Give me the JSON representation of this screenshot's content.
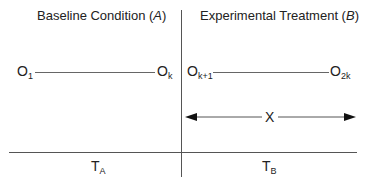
{
  "phases": {
    "baseline": {
      "title": "Baseline Condition (",
      "var": "A",
      "close": ")"
    },
    "treatment": {
      "title": "Experimental Treatment (",
      "var": "B",
      "close": ")"
    }
  },
  "observations": {
    "baseline_start": {
      "base": "O",
      "sub": "1"
    },
    "baseline_end": {
      "base": "O",
      "sub": "k"
    },
    "treatment_start": {
      "base": "O",
      "sub": "k+1"
    },
    "treatment_end": {
      "base": "O",
      "sub": "2k"
    }
  },
  "span_label": "X",
  "time_labels": {
    "a": {
      "base": "T",
      "sub": "A"
    },
    "b": {
      "base": "T",
      "sub": "B"
    }
  }
}
